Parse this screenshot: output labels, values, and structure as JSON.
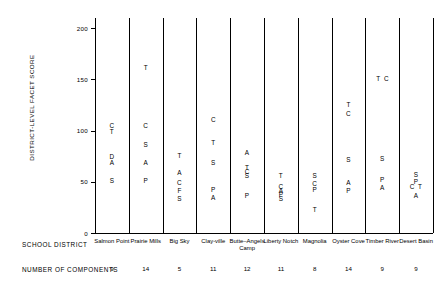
{
  "chart_data": {
    "type": "scatter",
    "title": "",
    "ylabel": "DISTRICT-LEVEL FACET SCORE",
    "xlabel": "SCHOOL DISTRICT",
    "ylim": [
      0,
      210
    ],
    "yticks": [
      0,
      50,
      100,
      150,
      200
    ],
    "ytick_labels": [
      "0",
      "50",
      "100",
      "150",
      "200"
    ],
    "grid": false,
    "legend": "none",
    "point_marker": "letter-code",
    "categories": [
      "Salmon Point",
      "Prairie Mills",
      "Big Sky",
      "Clay-ville",
      "Butte–Angels Camp",
      "Liberty Notch",
      "Magnolia",
      "Oyster Cove",
      "Timber River",
      "Desert Basin"
    ],
    "secondary_axis_label": "NUMBER OF COMPONENTS",
    "number_of_components": [
      9,
      14,
      5,
      11,
      12,
      11,
      8,
      14,
      9,
      9
    ],
    "series": [
      {
        "name": "Salmon Point",
        "points": [
          {
            "code": "C",
            "value": 104
          },
          {
            "code": "T",
            "value": 98
          },
          {
            "code": "D",
            "value": 74
          },
          {
            "code": "A",
            "value": 68
          },
          {
            "code": "S",
            "value": 51
          }
        ]
      },
      {
        "name": "Prairie Mills",
        "points": [
          {
            "code": "T",
            "value": 161
          },
          {
            "code": "C",
            "value": 104
          },
          {
            "code": "S",
            "value": 86
          },
          {
            "code": "A",
            "value": 68
          },
          {
            "code": "P",
            "value": 51
          }
        ]
      },
      {
        "name": "Big Sky",
        "points": [
          {
            "code": "T",
            "value": 75
          },
          {
            "code": "A",
            "value": 58
          },
          {
            "code": "C",
            "value": 49
          },
          {
            "code": "F",
            "value": 41
          },
          {
            "code": "S",
            "value": 33
          }
        ]
      },
      {
        "name": "Clay-ville",
        "points": [
          {
            "code": "C",
            "value": 110
          },
          {
            "code": "T",
            "value": 88
          },
          {
            "code": "S",
            "value": 68
          },
          {
            "code": "P",
            "value": 42
          },
          {
            "code": "A",
            "value": 34
          }
        ]
      },
      {
        "name": "Butte–Angels Camp",
        "points": [
          {
            "code": "A",
            "value": 78
          },
          {
            "code": "T",
            "value": 63
          },
          {
            "code": "C",
            "value": 59
          },
          {
            "code": "S",
            "value": 55
          },
          {
            "code": "P",
            "value": 36
          }
        ]
      },
      {
        "name": "Liberty Notch",
        "points": [
          {
            "code": "T",
            "value": 55
          },
          {
            "code": "C",
            "value": 45
          },
          {
            "code": "A",
            "value": 41
          },
          {
            "code": "P",
            "value": 37
          },
          {
            "code": "S",
            "value": 33
          }
        ]
      },
      {
        "name": "Magnolia",
        "points": [
          {
            "code": "S",
            "value": 55
          },
          {
            "code": "C",
            "value": 48
          },
          {
            "code": "P",
            "value": 42
          },
          {
            "code": "T",
            "value": 22
          }
        ]
      },
      {
        "name": "Oyster Cove",
        "points": [
          {
            "code": "T",
            "value": 125
          },
          {
            "code": "C",
            "value": 116
          },
          {
            "code": "S",
            "value": 71
          },
          {
            "code": "A",
            "value": 49
          },
          {
            "code": "P",
            "value": 41
          }
        ]
      },
      {
        "name": "Timber River",
        "points": [
          {
            "code": "T",
            "value": 150
          },
          {
            "code": "C",
            "value": 150
          },
          {
            "code": "S",
            "value": 72
          },
          {
            "code": "P",
            "value": 52
          },
          {
            "code": "A",
            "value": 44
          }
        ]
      },
      {
        "name": "Desert Basin",
        "points": [
          {
            "code": "S",
            "value": 56
          },
          {
            "code": "P",
            "value": 50
          },
          {
            "code": "C",
            "value": 45
          },
          {
            "code": "T",
            "value": 43
          },
          {
            "code": "A",
            "value": 36
          }
        ]
      }
    ]
  }
}
